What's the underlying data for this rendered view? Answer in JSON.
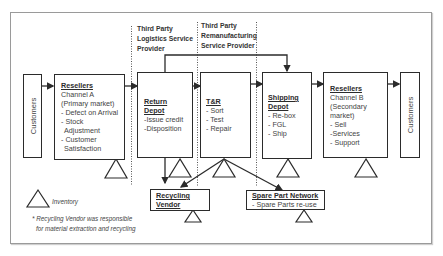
{
  "providers": {
    "logistics": [
      "Third Party",
      "Logistics Service",
      "Provider"
    ],
    "remanufacturing": [
      "Third Party",
      "Remanufacturing",
      "Service Provider"
    ]
  },
  "nodes": {
    "customers_left": {
      "label": "Customers"
    },
    "resellers_a": {
      "title": "Resellers",
      "lines": [
        "Channel A",
        "(Primary market)",
        "- Defect on Arrival",
        "- Stock",
        "  Adjustment",
        "- Customer",
        "  Satisfaction"
      ]
    },
    "return_depot": {
      "title_lines": [
        "Return",
        "Depot"
      ],
      "lines": [
        "-Issue credit",
        "-Disposition"
      ]
    },
    "tr": {
      "title": "T&R",
      "lines": [
        "- Sort",
        "- Test",
        "- Repair"
      ]
    },
    "shipping_depot": {
      "title_lines": [
        "Shipping",
        "Depot"
      ],
      "lines": [
        "- Re-box",
        "- FGL",
        "- Ship"
      ]
    },
    "resellers_b": {
      "title": "Resellers",
      "lines": [
        "Channel B",
        "(Secondary",
        "market)",
        "- Sell",
        "-Services",
        "- Support"
      ]
    },
    "customers_right": {
      "label": "Customers"
    },
    "recycling_vendor": {
      "title_lines": [
        "Recycling",
        "Vendor"
      ]
    },
    "spare_part_network": {
      "title": "Spare Part Network",
      "lines": [
        "- Spare Parts re-use"
      ]
    }
  },
  "legend": {
    "inventory_label": "Inventory"
  },
  "note": {
    "lines": [
      "* Recycling Vendor was responsible",
      "  for material extraction and recycling"
    ]
  },
  "colors": {
    "line": "#2b2b2b",
    "frame": "#9a9a9a",
    "text": "#444444"
  }
}
